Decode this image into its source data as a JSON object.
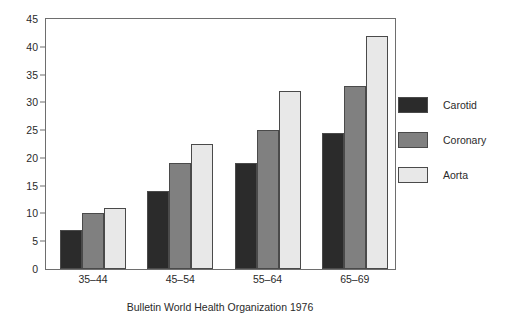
{
  "caption": "Bulletin World Health Organization 1976",
  "chart_data": {
    "type": "bar",
    "title": "",
    "subtitle": "",
    "xlabel": "",
    "ylabel": "",
    "categories": [
      "35–44",
      "45–54",
      "55–64",
      "65–69"
    ],
    "series": [
      {
        "name": "Carotid",
        "values": [
          7,
          14,
          19,
          24.5
        ],
        "color": "#2b2b2b"
      },
      {
        "name": "Coronary",
        "values": [
          10,
          19,
          25,
          33
        ],
        "color": "#808080"
      },
      {
        "name": "Aorta",
        "values": [
          11,
          22.5,
          32,
          42
        ],
        "color": "#e8e8e8"
      }
    ],
    "ylim": [
      0,
      45
    ],
    "yticks": [
      0,
      5,
      10,
      15,
      20,
      25,
      30,
      35,
      40,
      45
    ],
    "ytick_labels": [
      "0",
      "5",
      "10",
      "15",
      "20",
      "25",
      "30",
      "35",
      "40",
      "45"
    ],
    "grid": false,
    "legend_position": "right",
    "bar_edge_color": "#4a4a4a",
    "frame_color": "#6e6e6e"
  }
}
